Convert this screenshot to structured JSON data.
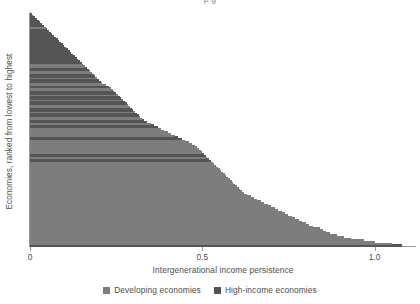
{
  "figure": {
    "clipped_title_fragment": "p g",
    "colors": {
      "developing": "#7d7d7d",
      "high_income": "#555555",
      "axis": "#9a9a9a",
      "text": "#4d4d4d",
      "background": "#ffffff"
    }
  },
  "axes": {
    "xlabel": "Intergenerational income persistence",
    "ylabel": "Economies, ranked from lowest to highest",
    "xticks": [
      "0",
      "0.5",
      "1.0"
    ],
    "xtick_values": [
      0,
      0.5,
      1.0
    ]
  },
  "legend": {
    "position": "bottom-center",
    "items": [
      {
        "label": "Developing economies",
        "color": "#7d7d7d",
        "key": "developing"
      },
      {
        "label": "High-income economies",
        "color": "#555555",
        "key": "high_income"
      }
    ]
  },
  "chart_data": {
    "type": "bar",
    "orientation": "horizontal",
    "title": "",
    "subtitle": "",
    "xlabel": "Intergenerational income persistence",
    "ylabel": "Economies, ranked from lowest to highest",
    "xlim": [
      0,
      1.12
    ],
    "grid": false,
    "legend_position": "bottom-center",
    "xticks": [
      0,
      0.5,
      1.0
    ],
    "xticklabels": [
      "0",
      "0.5",
      "1.0"
    ],
    "note": "Economies sorted from highest persistence (bottom) to lowest (top); each bar is one economy. Group encodes income classification.",
    "series": [
      {
        "name": "Developing economies",
        "color": "#7d7d7d"
      },
      {
        "name": "High-income economies",
        "color": "#555555"
      }
    ],
    "values": [
      1.08,
      1.05,
      1.0,
      0.97,
      0.93,
      0.91,
      0.89,
      0.87,
      0.86,
      0.85,
      0.84,
      0.82,
      0.81,
      0.8,
      0.79,
      0.78,
      0.77,
      0.76,
      0.75,
      0.74,
      0.73,
      0.72,
      0.71,
      0.7,
      0.69,
      0.68,
      0.67,
      0.66,
      0.65,
      0.64,
      0.63,
      0.62,
      0.615,
      0.61,
      0.605,
      0.6,
      0.595,
      0.59,
      0.585,
      0.58,
      0.575,
      0.57,
      0.565,
      0.56,
      0.555,
      0.55,
      0.545,
      0.54,
      0.535,
      0.53,
      0.525,
      0.52,
      0.515,
      0.51,
      0.505,
      0.5,
      0.495,
      0.49,
      0.485,
      0.48,
      0.47,
      0.46,
      0.45,
      0.44,
      0.43,
      0.42,
      0.41,
      0.4,
      0.39,
      0.38,
      0.37,
      0.36,
      0.35,
      0.34,
      0.33,
      0.325,
      0.32,
      0.315,
      0.31,
      0.305,
      0.3,
      0.295,
      0.29,
      0.285,
      0.28,
      0.275,
      0.27,
      0.265,
      0.26,
      0.255,
      0.25,
      0.245,
      0.24,
      0.235,
      0.23,
      0.22,
      0.21,
      0.205,
      0.2,
      0.195,
      0.19,
      0.185,
      0.18,
      0.175,
      0.17,
      0.165,
      0.16,
      0.155,
      0.15,
      0.145,
      0.14,
      0.135,
      0.13,
      0.125,
      0.12,
      0.115,
      0.11,
      0.105,
      0.1,
      0.095,
      0.09,
      0.085,
      0.08,
      0.075,
      0.07,
      0.065,
      0.06,
      0.055,
      0.05,
      0.045,
      0.04,
      0.035,
      0.03,
      0.025,
      0.02,
      0.015,
      0.01,
      0.005
    ],
    "groups": [
      "high_income",
      "developing",
      "developing",
      "developing",
      "developing",
      "developing",
      "developing",
      "developing",
      "developing",
      "developing",
      "developing",
      "developing",
      "developing",
      "developing",
      "developing",
      "developing",
      "developing",
      "developing",
      "developing",
      "developing",
      "developing",
      "developing",
      "developing",
      "developing",
      "developing",
      "developing",
      "developing",
      "developing",
      "developing",
      "developing",
      "developing",
      "developing",
      "developing",
      "developing",
      "developing",
      "developing",
      "developing",
      "developing",
      "developing",
      "developing",
      "developing",
      "developing",
      "developing",
      "developing",
      "developing",
      "developing",
      "developing",
      "developing",
      "developing",
      "developing",
      "high_income",
      "high_income",
      "developing",
      "high_income",
      "high_income",
      "developing",
      "developing",
      "developing",
      "developing",
      "developing",
      "developing",
      "developing",
      "developing",
      "high_income",
      "high_income",
      "developing",
      "developing",
      "developing",
      "developing",
      "developing",
      "high_income",
      "high_income",
      "developing",
      "high_income",
      "high_income",
      "developing",
      "developing",
      "high_income",
      "high_income",
      "developing",
      "high_income",
      "high_income",
      "developing",
      "developing",
      "high_income",
      "high_income",
      "developing",
      "high_income",
      "high_income",
      "developing",
      "high_income",
      "high_income",
      "developing",
      "developing",
      "high_income",
      "developing",
      "developing",
      "high_income",
      "high_income",
      "developing",
      "high_income",
      "high_income",
      "developing",
      "developing",
      "high_income",
      "high_income",
      "developing",
      "developing",
      "high_income",
      "high_income",
      "high_income",
      "high_income",
      "high_income",
      "high_income",
      "high_income",
      "high_income",
      "high_income",
      "high_income",
      "high_income",
      "high_income",
      "high_income",
      "high_income",
      "high_income",
      "high_income",
      "high_income",
      "high_income",
      "high_income",
      "high_income",
      "high_income",
      "developing",
      "high_income",
      "high_income",
      "high_income",
      "high_income",
      "high_income",
      "high_income",
      "high_income",
      "high_income"
    ]
  }
}
